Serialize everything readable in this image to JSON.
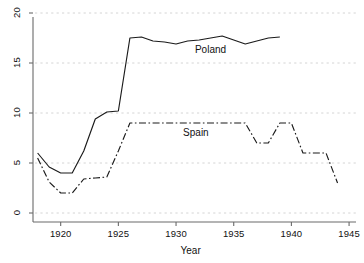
{
  "chart_data": {
    "type": "line",
    "title": "",
    "subtitle": "",
    "xlabel": "Year",
    "ylabel": "",
    "xlim": [
      1917.6,
      1945.6
    ],
    "ylim": [
      0,
      20
    ],
    "xticks": [
      1920,
      1925,
      1930,
      1935,
      1940,
      1945
    ],
    "xtick_labels": [
      "1920",
      "1925",
      "1930",
      "1935",
      "1940",
      "1945"
    ],
    "yticks": [
      0,
      5,
      10,
      15,
      20
    ],
    "ytick_labels": [
      "0",
      "5",
      "10",
      "15",
      "20"
    ],
    "grid": "horizontal-dashed",
    "legend": "inline-annotations",
    "series": [
      {
        "name": "Poland",
        "style": "solid",
        "color": "#1a1a1a",
        "label_x": 1933.2,
        "label_y": 16.2,
        "x": [
          1918,
          1919,
          1920,
          1921,
          1922,
          1923,
          1924,
          1925,
          1926,
          1927,
          1928,
          1929,
          1930,
          1931,
          1932,
          1933,
          1934,
          1935,
          1936,
          1937,
          1938,
          1939
        ],
        "values": [
          6.0,
          4.6,
          4.0,
          4.0,
          6.2,
          9.4,
          10.1,
          10.2,
          17.5,
          17.6,
          17.2,
          17.1,
          16.9,
          17.2,
          17.3,
          17.5,
          17.7,
          17.3,
          16.9,
          17.2,
          17.5,
          17.6
        ]
      },
      {
        "name": "Spain",
        "style": "dash-dot",
        "color": "#1a1a1a",
        "label_x": 1932.0,
        "label_y": 7.9,
        "x": [
          1918,
          1919,
          1920,
          1921,
          1922,
          1923,
          1924,
          1925,
          1926,
          1927,
          1928,
          1929,
          1930,
          1931,
          1932,
          1933,
          1934,
          1935,
          1936,
          1937,
          1938,
          1939,
          1940,
          1941,
          1942,
          1943,
          1944
        ],
        "values": [
          5.5,
          3.1,
          2.0,
          2.0,
          3.4,
          3.5,
          3.6,
          6.2,
          9.0,
          9.0,
          9.0,
          9.0,
          9.0,
          9.0,
          9.0,
          9.0,
          9.0,
          9.0,
          9.0,
          7.0,
          7.0,
          9.0,
          9.0,
          6.0,
          6.0,
          6.0,
          3.0
        ]
      }
    ]
  },
  "axis": {
    "x_title": "Year"
  },
  "labels": {
    "poland": "Poland",
    "spain": "Spain"
  }
}
